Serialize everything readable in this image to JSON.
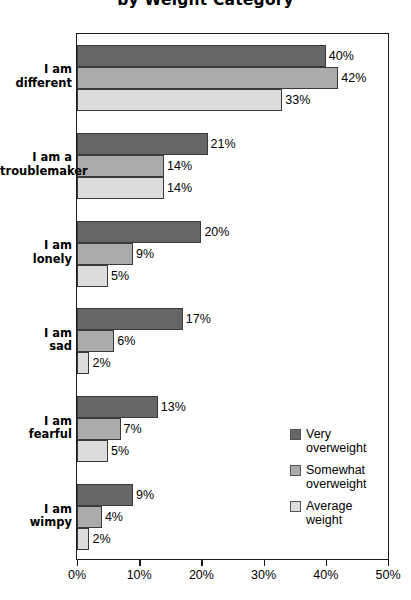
{
  "chart_data": {
    "type": "bar",
    "orientation": "horizontal",
    "title": "by Weight Category",
    "xlabel": "",
    "ylabel": "",
    "xlim": [
      0,
      50
    ],
    "xtick_labels": [
      "0%",
      "10%",
      "20%",
      "30%",
      "40%",
      "50%"
    ],
    "xticks": [
      0,
      10,
      20,
      30,
      40,
      50
    ],
    "grid": false,
    "legend_position": "inside-right",
    "categories": [
      "I am\ndifferent",
      "I am a\ntroublemaker",
      "I am\nlonely",
      "I am\nsad",
      "I am\nfearful",
      "I am\nwimpy"
    ],
    "series": [
      {
        "name": "Very\noverweight",
        "color": "#666666",
        "values": [
          40,
          21,
          20,
          17,
          13,
          9
        ],
        "labels": [
          "40%",
          "21%",
          "20%",
          "17%",
          "13%",
          "9%"
        ]
      },
      {
        "name": "Somewhat\noverweight",
        "color": "#ababab",
        "values": [
          42,
          14,
          9,
          6,
          7,
          4
        ],
        "labels": [
          "42%",
          "14%",
          "9%",
          "6%",
          "7%",
          "4%"
        ]
      },
      {
        "name": "Average\nweight",
        "color": "#dcdcdc",
        "values": [
          33,
          14,
          5,
          2,
          5,
          2
        ],
        "labels": [
          "33%",
          "14%",
          "5%",
          "2%",
          "5%",
          "2%"
        ]
      }
    ]
  }
}
